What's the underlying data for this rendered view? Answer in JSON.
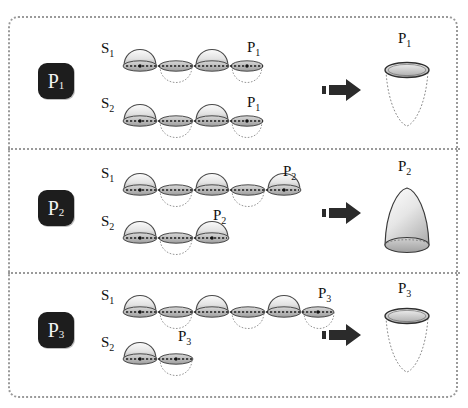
{
  "figure": {
    "type": "orbital-interaction-diagram",
    "background": "#ffffff",
    "border_color": "#9a9a9a",
    "lobe_fill_top": "#f2f2f2",
    "lobe_fill_bottom": "#bdbdbd",
    "lobe_stroke": "#4a4a4a",
    "badge_bg": "#1d1d1d",
    "badge_fg": "#f2f2f2",
    "arrow_color": "#2b2b2b"
  },
  "panels": [
    {
      "id": "panel-p1",
      "badge": "P",
      "badge_sub": "1",
      "rows": [
        {
          "label": "S",
          "label_sub": "1",
          "end_label": "P",
          "end_label_sub": "1",
          "up_lobes": 2,
          "down_lobes": 2,
          "ends_on": "down",
          "segments": [
            "up",
            "down",
            "up",
            "down"
          ]
        },
        {
          "label": "S",
          "label_sub": "2",
          "end_label": "P",
          "end_label_sub": "1",
          "up_lobes": 2,
          "down_lobes": 2,
          "ends_on": "down",
          "segments": [
            "up",
            "down",
            "up",
            "down"
          ]
        }
      ],
      "result": {
        "label": "P",
        "label_sub": "1",
        "shape": "cone-down",
        "rim": "top"
      }
    },
    {
      "id": "panel-p2",
      "badge": "P",
      "badge_sub": "2",
      "rows": [
        {
          "label": "S",
          "label_sub": "1",
          "end_label": "P",
          "end_label_sub": "2",
          "up_lobes": 3,
          "down_lobes": 2,
          "ends_on": "up",
          "segments": [
            "up",
            "down",
            "up",
            "down",
            "up"
          ]
        },
        {
          "label": "S",
          "label_sub": "2",
          "end_label": "P",
          "end_label_sub": "2",
          "up_lobes": 2,
          "down_lobes": 1,
          "ends_on": "up",
          "segments": [
            "up",
            "down",
            "up"
          ]
        }
      ],
      "result": {
        "label": "P",
        "label_sub": "2",
        "shape": "dome-up",
        "rim": "bottom"
      }
    },
    {
      "id": "panel-p3",
      "badge": "P",
      "badge_sub": "3",
      "rows": [
        {
          "label": "S",
          "label_sub": "1",
          "end_label": "P",
          "end_label_sub": "3",
          "up_lobes": 3,
          "down_lobes": 3,
          "ends_on": "down",
          "segments": [
            "up",
            "down",
            "up",
            "down",
            "up",
            "down"
          ]
        },
        {
          "label": "S",
          "label_sub": "2",
          "end_label": "P",
          "end_label_sub": "3",
          "up_lobes": 1,
          "down_lobes": 1,
          "ends_on": "down",
          "segments": [
            "up",
            "down"
          ]
        }
      ],
      "result": {
        "label": "P",
        "label_sub": "3",
        "shape": "cone-down",
        "rim": "top"
      }
    }
  ],
  "arrow": {
    "glyph": "implies-arrow",
    "count": 3
  }
}
